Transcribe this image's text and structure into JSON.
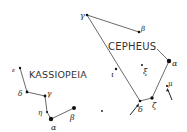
{
  "constellations": [
    {
      "name": "CEPHEUS",
      "stars": [
        {
          "id": "gamma",
          "label": "γ"
        },
        {
          "id": "beta",
          "label": "β"
        },
        {
          "id": "alpha",
          "label": "α"
        },
        {
          "id": "zeta",
          "label": "ζ"
        },
        {
          "id": "delta",
          "label": "δ"
        },
        {
          "id": "iota",
          "label": "ι"
        },
        {
          "id": "xi",
          "label": "ξ"
        },
        {
          "id": "mu",
          "label": "μ"
        }
      ]
    },
    {
      "name": "KASSIOPEIA",
      "stars": [
        {
          "id": "epsilon",
          "label": "ε"
        },
        {
          "id": "delta",
          "label": "δ"
        },
        {
          "id": "gamma",
          "label": "γ"
        },
        {
          "id": "eta",
          "label": "η"
        },
        {
          "id": "alpha",
          "label": "α"
        },
        {
          "id": "beta",
          "label": "β"
        }
      ]
    }
  ],
  "colors": {
    "ink": "#111111",
    "background": "#ffffff"
  }
}
